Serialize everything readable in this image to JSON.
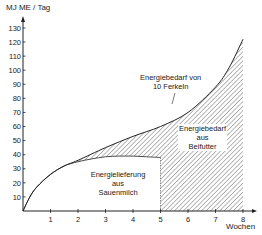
{
  "chart_data": {
    "type": "area",
    "title": "",
    "ylabel": "MJ ME / Tag",
    "xlabel": "Wochen",
    "xlim": [
      0,
      8
    ],
    "ylim": [
      0,
      130
    ],
    "x_ticks": [
      1,
      2,
      3,
      4,
      5,
      6,
      7,
      8
    ],
    "y_ticks": [
      10,
      20,
      30,
      40,
      50,
      60,
      70,
      80,
      90,
      100,
      110,
      120,
      130
    ],
    "grid": false,
    "series": [
      {
        "name": "Energiebedarf von 10 Ferkeln",
        "x": [
          0,
          0.25,
          0.5,
          1,
          1.5,
          2,
          3,
          4,
          5,
          6,
          7,
          7.5,
          8
        ],
        "values": [
          0,
          10,
          17,
          26,
          32,
          36,
          45,
          53,
          60,
          70,
          88,
          102,
          122
        ]
      },
      {
        "name": "Energielieferung aus Sauenmilch",
        "x": [
          0,
          0.25,
          0.5,
          1,
          1.5,
          2,
          2.5,
          3,
          3.5,
          4,
          4.5,
          5
        ],
        "values": [
          0,
          10,
          17,
          26,
          32,
          35,
          37,
          38.5,
          39,
          39,
          38.5,
          38
        ]
      }
    ],
    "annotations": [
      {
        "text": "Energiebedarf von 10 Ferkeln",
        "role": "label for demand curve"
      },
      {
        "text": "Energiebedarf aus Beifutter",
        "role": "hatched region between curves / after week 5"
      },
      {
        "text": "Energielieferung aus Sauenmilch",
        "role": "area under milk supply curve"
      }
    ]
  },
  "labels": {
    "ylabel": "MJ ME / Tag",
    "xlabel": "Wochen",
    "demand_line1": "Energiebedarf von",
    "demand_line2": "10 Ferkeln",
    "beifutter_line1": "Energiebedarf",
    "beifutter_line2": "aus",
    "beifutter_line3": "Beifutter",
    "milk_line1": "Energielieferung",
    "milk_line2": "aus",
    "milk_line3": "Sauenmilch"
  }
}
